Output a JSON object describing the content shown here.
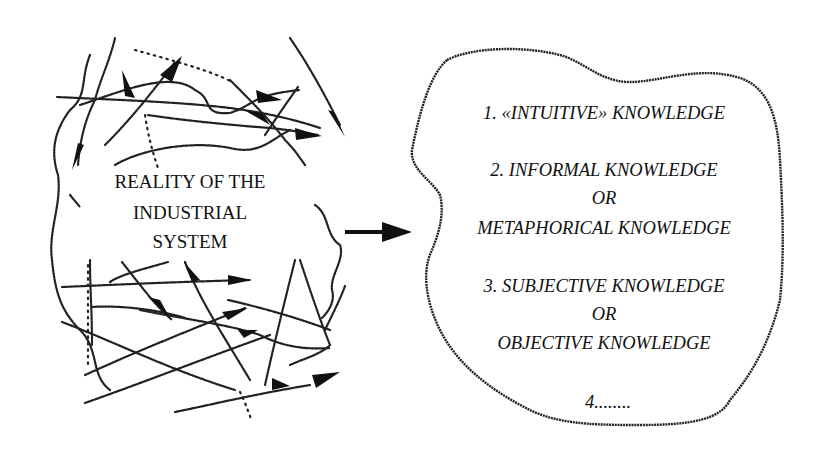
{
  "left_box": {
    "lines": [
      "REALITY OF THE",
      "INDUSTRIAL",
      "SYSTEM"
    ]
  },
  "connector": {
    "icon": "arrow-right-icon"
  },
  "right_box": {
    "lines": [
      "1. «INTUITIVE» KNOWLEDGE",
      "2. INFORMAL KNOWLEDGE",
      "OR",
      "METAPHORICAL KNOWLEDGE",
      "3. SUBJECTIVE KNOWLEDGE",
      "OR",
      "OBJECTIVE KNOWLEDGE",
      "4........"
    ]
  }
}
